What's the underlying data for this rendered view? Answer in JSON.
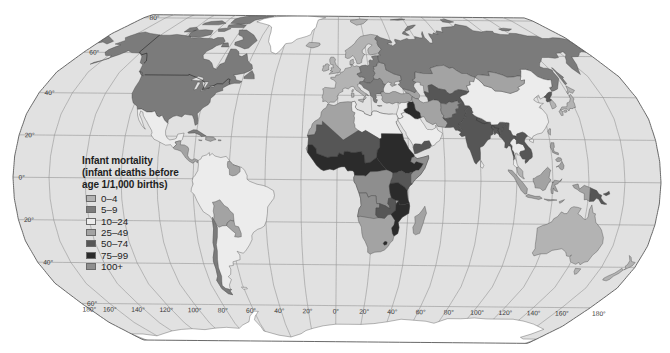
{
  "legend": {
    "title_lines": [
      "Infant mortality",
      "(infant deaths before",
      "age 1/1,000 births)"
    ],
    "items": [
      {
        "label": "0–4",
        "color": "#b3b3b3"
      },
      {
        "label": "5–9",
        "color": "#7b7b7b"
      },
      {
        "label": "10–24",
        "color": "#ececec"
      },
      {
        "label": "25–49",
        "color": "#a3a3a3"
      },
      {
        "label": "50–74",
        "color": "#565656"
      },
      {
        "label": "75–99",
        "color": "#2b2b2b"
      },
      {
        "label": "100+",
        "color": "#8e8e8e"
      }
    ]
  },
  "graticule": {
    "latitude_labels": [
      {
        "lat": 80,
        "label": "80°"
      },
      {
        "lat": 60,
        "label": "60°"
      },
      {
        "lat": 40,
        "label": "40°"
      },
      {
        "lat": 20,
        "label": "20°"
      },
      {
        "lat": 0,
        "label": "0°"
      },
      {
        "lat": -20,
        "label": "20°"
      },
      {
        "lat": -40,
        "label": "40°"
      },
      {
        "lat": -60,
        "label": "60°"
      }
    ],
    "longitude_labels": [
      {
        "lon": -180,
        "label": "180°"
      },
      {
        "lon": -160,
        "label": "160°"
      },
      {
        "lon": -140,
        "label": "140°"
      },
      {
        "lon": -120,
        "label": "120°"
      },
      {
        "lon": -100,
        "label": "100°"
      },
      {
        "lon": -80,
        "label": "80°"
      },
      {
        "lon": -60,
        "label": "60°"
      },
      {
        "lon": -40,
        "label": "40°"
      },
      {
        "lon": -20,
        "label": "20°"
      },
      {
        "lon": 0,
        "label": "0°"
      },
      {
        "lon": 20,
        "label": "20°"
      },
      {
        "lon": 40,
        "label": "40°"
      },
      {
        "lon": 60,
        "label": "60°"
      },
      {
        "lon": 80,
        "label": "80°"
      },
      {
        "lon": 100,
        "label": "100°"
      },
      {
        "lon": 120,
        "label": "120°"
      },
      {
        "lon": 140,
        "label": "140°"
      },
      {
        "lon": 160,
        "label": "160°"
      },
      {
        "lon": 180,
        "label": "180°"
      }
    ]
  },
  "map": {
    "ocean_color": "#e1e1e1",
    "no_data_color": "#ffffff",
    "regions": [
      {
        "id": "canada-usa",
        "category": "5–9"
      },
      {
        "id": "greenland",
        "category": null
      },
      {
        "id": "iceland",
        "category": "0–4"
      },
      {
        "id": "mexico",
        "category": "10–24"
      },
      {
        "id": "central-america",
        "category": "25–49"
      },
      {
        "id": "cuba",
        "category": "5–9"
      },
      {
        "id": "caribbean",
        "category": "25–49"
      },
      {
        "id": "south-america",
        "category": "10–24"
      },
      {
        "id": "chile",
        "category": "5–9"
      },
      {
        "id": "bolivia",
        "category": "25–49"
      },
      {
        "id": "paraguay",
        "category": "25–49"
      },
      {
        "id": "guianas",
        "category": "25–49"
      },
      {
        "id": "scandinavia",
        "category": "0–4"
      },
      {
        "id": "svalbard",
        "category": "0–4"
      },
      {
        "id": "denmark",
        "category": "0–4"
      },
      {
        "id": "british-isles",
        "category": "0–4"
      },
      {
        "id": "western-europe",
        "category": "0–4"
      },
      {
        "id": "central-europe",
        "category": "5–9"
      },
      {
        "id": "ukraine-belarus",
        "category": "25–49"
      },
      {
        "id": "balkans",
        "category": "5–9"
      },
      {
        "id": "turkey",
        "category": "25–49"
      },
      {
        "id": "caucasus",
        "category": "25–49"
      },
      {
        "id": "russia",
        "category": "5–9"
      },
      {
        "id": "kazakhstan",
        "category": "25–49"
      },
      {
        "id": "central-asia",
        "category": "50–74"
      },
      {
        "id": "iran",
        "category": "25–49"
      },
      {
        "id": "iraq",
        "category": "75–99"
      },
      {
        "id": "levant",
        "category": "10–24"
      },
      {
        "id": "arabia",
        "category": "10–24"
      },
      {
        "id": "yemen",
        "category": "50–74"
      },
      {
        "id": "afghanistan",
        "category": "100+"
      },
      {
        "id": "pakistan",
        "category": "50–74"
      },
      {
        "id": "india",
        "category": "50–74"
      },
      {
        "id": "sri-lanka",
        "category": "10–24"
      },
      {
        "id": "china",
        "category": "10–24"
      },
      {
        "id": "mongolia",
        "category": "25–49"
      },
      {
        "id": "north-korea",
        "category": "50–74"
      },
      {
        "id": "south-korea",
        "category": "0–4"
      },
      {
        "id": "japan",
        "category": "0–4"
      },
      {
        "id": "taiwan",
        "category": "0–4"
      },
      {
        "id": "myanmar",
        "category": "50–74"
      },
      {
        "id": "thailand",
        "category": "10–24"
      },
      {
        "id": "indochina",
        "category": "50–74"
      },
      {
        "id": "malaysia",
        "category": "0–4"
      },
      {
        "id": "indonesia",
        "category": "25–49"
      },
      {
        "id": "philippines",
        "category": "25–49"
      },
      {
        "id": "papua-new-guinea",
        "category": "50–74"
      },
      {
        "id": "australia",
        "category": "0–4"
      },
      {
        "id": "new-zealand",
        "category": "0–4"
      },
      {
        "id": "africa",
        "category": "25–49"
      },
      {
        "id": "libya-egypt",
        "category": "10–24"
      },
      {
        "id": "sahel",
        "category": "50–74"
      },
      {
        "id": "west-central-africa",
        "category": "75–99"
      },
      {
        "id": "sudan-ethiopia",
        "category": "75–99"
      },
      {
        "id": "somalia",
        "category": "100+"
      },
      {
        "id": "kenya-uganda",
        "category": "50–74"
      },
      {
        "id": "dr-congo",
        "category": "100+"
      },
      {
        "id": "angola",
        "category": "100+"
      },
      {
        "id": "zambia",
        "category": "50–74"
      },
      {
        "id": "tanzania",
        "category": "75–99"
      },
      {
        "id": "mozambique",
        "category": "75–99"
      },
      {
        "id": "lesotho",
        "category": "75–99"
      },
      {
        "id": "madagascar",
        "category": "25–49"
      },
      {
        "id": "antarctica",
        "category": null
      }
    ]
  }
}
